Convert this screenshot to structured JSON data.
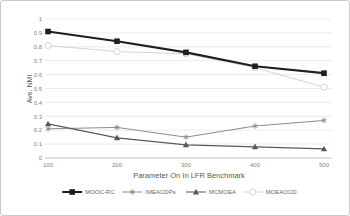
{
  "chart_data": {
    "type": "line",
    "title": "",
    "xlabel": "Parameter On In LFR Benchmark",
    "ylabel": "Ave. NMI",
    "x": [
      100,
      200,
      300,
      400,
      500
    ],
    "x_tick_labels": [
      "100",
      "200",
      "300",
      "400",
      "500"
    ],
    "y_tick_labels": [
      "0",
      "0.1",
      "0.2",
      "0.3",
      "0.4",
      "0.5",
      "0.6",
      "0.7",
      "0.8",
      "0.9",
      "1"
    ],
    "y_ticks": [
      0,
      0.1,
      0.2,
      0.3,
      0.4,
      0.5,
      0.6,
      0.7,
      0.8,
      0.9,
      1
    ],
    "ylim": [
      0,
      1
    ],
    "grid": "horizontal",
    "legend_position": "bottom",
    "series": [
      {
        "name": "MOOC-RC",
        "marker": "square",
        "color": "#1f1f1f",
        "line_width": 2.2,
        "values": [
          0.91,
          0.84,
          0.76,
          0.66,
          0.61
        ]
      },
      {
        "name": "IMEACDPs",
        "marker": "asterisk",
        "color": "#8c8c8c",
        "line_width": 1,
        "values": [
          0.21,
          0.22,
          0.15,
          0.23,
          0.27
        ]
      },
      {
        "name": "MCMOEA",
        "marker": "triangle",
        "color": "#595959",
        "line_width": 1.2,
        "values": [
          0.245,
          0.145,
          0.095,
          0.08,
          0.065
        ]
      },
      {
        "name": "MOEAOCD",
        "marker": "open-circle",
        "color": "#d4d4d4",
        "line_width": 1,
        "values": [
          0.81,
          0.765,
          0.75,
          0.65,
          0.51
        ]
      }
    ],
    "draw_order": [
      3,
      1,
      2,
      0
    ],
    "colors": {
      "gridline": "#ececec",
      "axis_line": "#c6c6c6",
      "tick_label": "#7f7f7f",
      "axis_title": "#595959",
      "legend_text": "#666666",
      "background": "#ffffff"
    }
  }
}
